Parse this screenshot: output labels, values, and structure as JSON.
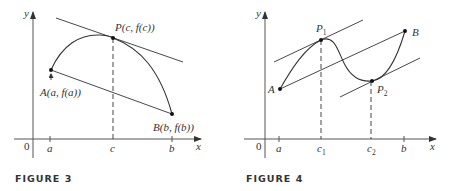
{
  "figures": [
    {
      "id": "figure-3",
      "caption": "FIGURE 3",
      "axis_labels": {
        "x": "x",
        "y": "y",
        "origin": "0"
      },
      "ticks": [
        "a",
        "c",
        "b"
      ],
      "points": {
        "A": "A(a, f(a))",
        "P": "P(c, f(c))",
        "B": "B(b, f(b))"
      },
      "elements": [
        "curve from A to B",
        "secant line AB",
        "tangent line at P parallel to AB",
        "dashed vertical line from P to c"
      ]
    },
    {
      "id": "figure-4",
      "caption": "FIGURE 4",
      "axis_labels": {
        "x": "x",
        "y": "y",
        "origin": "0"
      },
      "ticks": [
        "a",
        "c1",
        "c2",
        "b"
      ],
      "tick_labels": {
        "a": "a",
        "c1_main": "c",
        "c1_sub": "1",
        "c2_main": "c",
        "c2_sub": "2",
        "b": "b"
      },
      "points": {
        "A": "A",
        "B": "B",
        "P1_main": "P",
        "P1_sub": "1",
        "P2_main": "P",
        "P2_sub": "2"
      },
      "elements": [
        "S-shaped curve from A to B",
        "secant line AB",
        "tangent at P1 parallel to AB",
        "tangent at P2 parallel to AB",
        "dashed vertical lines from P1 to c1 and P2 to c2"
      ]
    }
  ]
}
